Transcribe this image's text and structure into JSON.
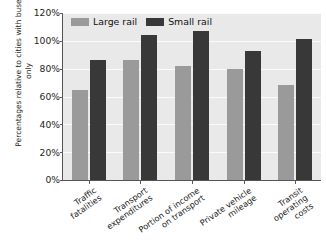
{
  "chart_data": {
    "type": "bar",
    "title": "",
    "xlabel": "",
    "ylabel": "Percentages relative to cities with buses only",
    "ylim": [
      0,
      120
    ],
    "grid": true,
    "legend_position": "top-left-inside",
    "categories": [
      "Traffic\nfatalities",
      "Transport\nexpenditures",
      "Portion of income\non transport",
      "Private vehicle\nmileage",
      "Transit\noperating\ncosts"
    ],
    "ytick_labels": [
      "0%",
      "20%",
      "40%",
      "60%",
      "80%",
      "100%",
      "120%"
    ],
    "ytick_values": [
      0,
      20,
      40,
      60,
      80,
      100,
      120
    ],
    "series": [
      {
        "name": "Large rail",
        "color": "#9a9a9a",
        "values": [
          65,
          86,
          82,
          80,
          68
        ]
      },
      {
        "name": "Small rail",
        "color": "#383838",
        "values": [
          86,
          104,
          107,
          93,
          101
        ]
      }
    ]
  },
  "colors": {
    "plot_background": "#e9e9e9",
    "gridline": "#fbfbfb",
    "axis": "#555555",
    "large_rail": "#9a9a9a",
    "small_rail": "#383838",
    "text": "#1d1d1d"
  }
}
